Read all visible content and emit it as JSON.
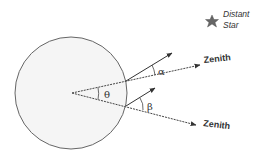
{
  "diagram": {
    "labels": {
      "distant_star_line1": "Distant",
      "distant_star_line2": "Star",
      "zenith_upper": "Zenith",
      "zenith_lower": "Zenith",
      "theta": "θ",
      "alpha": "α",
      "beta": "β"
    },
    "colors": {
      "line": "#555555",
      "circle_stroke": "#666666",
      "circle_fill": "#f4f4f4",
      "star": "#666666",
      "text": "#333333"
    }
  }
}
